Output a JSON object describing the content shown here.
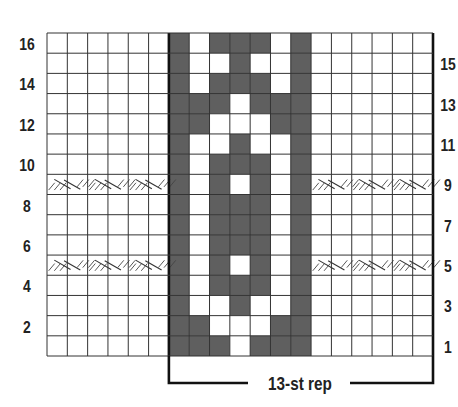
{
  "chart_title": "",
  "grid": {
    "columns": 19,
    "rows": 16,
    "left_edge_columns": 6,
    "repeat_columns": 13,
    "center_panel_columns": 7,
    "colors": {
      "contrast": "#5f5f5f",
      "main": "#ffffff",
      "line": "#333333"
    }
  },
  "center_panel_rows": {
    "16": "GWGGGWG",
    "15": "GWWGWWG",
    "14": "GWGGGWG",
    "13": "GGGWGGG",
    "12": "GGWWWGG",
    "11": "GWWGWWG",
    "10": "GWGGGWG",
    "9": "GWGWGWG",
    "8": "GWGGGWG",
    "7": "GWGGGWG",
    "6": "GWGGGWG",
    "5": "GWGWGWG",
    "4": "GWGGGWG",
    "3": "GWWGWWG",
    "2": "GGWWWGG",
    "1": "GGGWGGG"
  },
  "cable_rows": [
    5,
    9
  ],
  "cable_symbol": "cable-cross",
  "row_labels": {
    "left": [
      "16",
      "14",
      "12",
      "10",
      "8",
      "6",
      "4",
      "2"
    ],
    "right": [
      "15",
      "13",
      "11",
      "9",
      "7",
      "5",
      "3",
      "1"
    ]
  },
  "repeat_bracket": {
    "label": "13-st rep"
  }
}
